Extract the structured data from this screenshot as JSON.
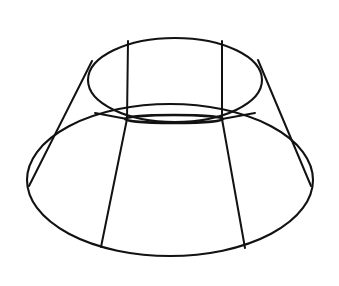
{
  "figure": {
    "background_color": "#ffffff",
    "stroke_color": "#121212",
    "canvas": {
      "width": 339,
      "height": 286
    }
  },
  "chart_data": {
    "type": "diagram",
    "projection": "oblique perspective, viewed slightly from below",
    "elements": [
      {
        "name": "top-rim-ellipse",
        "kind": "ellipse",
        "cx": 175,
        "cy": 80,
        "rx": 87,
        "ry": 42,
        "stroke_width": 2.1
      },
      {
        "name": "waist-ellipse",
        "kind": "ellipse",
        "cx": 174,
        "cy": 119,
        "rx": 49,
        "ry": 4,
        "stroke_width": 2.6
      },
      {
        "name": "bottom-rim-ellipse",
        "kind": "ellipse",
        "cx": 170,
        "cy": 180,
        "rx": 143,
        "ry": 76,
        "stroke_width": 2.1
      }
    ],
    "slant_lines": [
      {
        "name": "outer-slant-left",
        "x1": 92,
        "y1": 61,
        "x2": 29,
        "y2": 186,
        "stroke_width": 2.0
      },
      {
        "name": "outer-slant-right",
        "x1": 258,
        "y1": 60,
        "x2": 311,
        "y2": 186,
        "stroke_width": 2.0
      },
      {
        "name": "meridian-left-upper",
        "x1": 128,
        "y1": 41,
        "x2": 127,
        "y2": 119,
        "stroke_width": 2.0
      },
      {
        "name": "meridian-right-upper",
        "x1": 222,
        "y1": 41,
        "x2": 222,
        "y2": 119,
        "stroke_width": 2.0
      },
      {
        "name": "meridian-left-lower",
        "x1": 127,
        "y1": 119,
        "x2": 101,
        "y2": 247,
        "stroke_width": 2.0
      },
      {
        "name": "meridian-right-lower",
        "x1": 222,
        "y1": 119,
        "x2": 245,
        "y2": 248,
        "stroke_width": 2.0
      },
      {
        "name": "waist-edge-left",
        "x1": 127,
        "y1": 119,
        "x2": 95,
        "y2": 113,
        "stroke_width": 1.9
      },
      {
        "name": "waist-edge-right",
        "x1": 222,
        "y1": 119,
        "x2": 255,
        "y2": 113,
        "stroke_width": 1.9
      }
    ],
    "axis_ranges": {
      "x": [
        0,
        339
      ],
      "y": [
        0,
        286
      ]
    },
    "grid": false,
    "legend": null,
    "annotations": []
  }
}
